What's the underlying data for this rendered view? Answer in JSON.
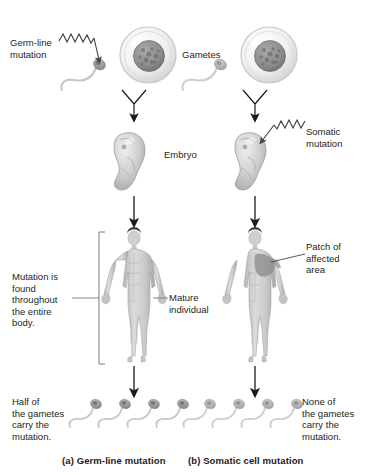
{
  "figure": {
    "title_panels": [
      {
        "id": "a",
        "caption": "(a) Germ-line mutation"
      },
      {
        "id": "b",
        "caption": "(b) Somatic cell mutation"
      }
    ],
    "center_labels": [
      {
        "name": "gametes",
        "text": "Gametes"
      },
      {
        "name": "embryo",
        "text": "Embryo"
      },
      {
        "name": "mature-individual",
        "text": "Mature\nindividual"
      }
    ],
    "left_panel": {
      "mutation_label": "Germ-line\nmutation",
      "body_label": "Mutation is\nfound\nthroughout\nthe entire\nbody.",
      "gamete_outcome": "Half of\nthe gametes\ncarry the\nmutation.",
      "sperm_count": 4
    },
    "right_panel": {
      "mutation_label": "Somatic\nmutation",
      "patch_label": "Patch of\naffected\narea",
      "gamete_outcome": "None of\nthe gametes\ncarry the\nmutation.",
      "sperm_count": 4
    },
    "colors": {
      "text": "#231f20",
      "arrow": "#1a1a1a",
      "bracket": "#6e6e6e",
      "leader": "#4a4a4a",
      "cell_membrane": "#cfcfcf",
      "cell_fill": "#f2f2f2",
      "nucleus": "#8a8a8a",
      "sperm_head_mutant": "#9a9a9a",
      "sperm_head_normal": "#b5b5b5",
      "sperm_tail": "#c9c9c9",
      "embryo": "#c6c6c6",
      "body": "#c2c2c2",
      "patch": "#8f8f8f",
      "hair": "#3a3a3a"
    }
  }
}
